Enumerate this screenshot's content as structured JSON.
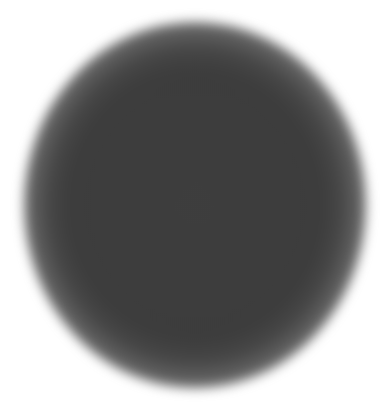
{
  "image": {
    "subject": "blurred dark circle",
    "background_color": "#ffffff",
    "core_color": "#3a3a3a"
  }
}
